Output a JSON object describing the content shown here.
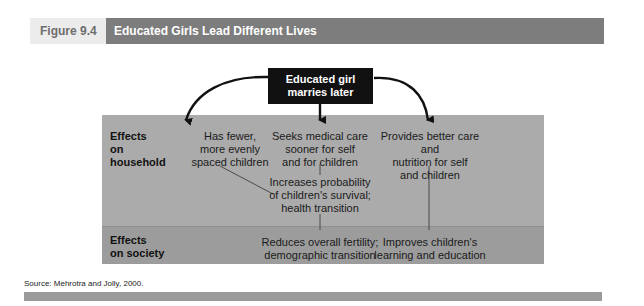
{
  "figure": {
    "label": "Figure 9.4",
    "title": "Educated Girls Lead Different Lives"
  },
  "diagram": {
    "root": "Educated girl marries later",
    "root_lines": [
      "Educated girl",
      "marries later"
    ],
    "rows": {
      "household": {
        "label_lines": [
          "Effects",
          "on",
          "household"
        ]
      },
      "society": {
        "label_lines": [
          "Effects",
          "on society"
        ]
      }
    },
    "nodes": {
      "fewer_children": [
        "Has fewer,",
        "more evenly",
        "spaced children"
      ],
      "medical_care": [
        "Seeks medical care",
        "sooner for self",
        "and for children"
      ],
      "better_care": [
        "Provides better care and",
        "nutrition for self",
        "and children"
      ],
      "survival": [
        "Increases probability",
        "of children's survival;",
        "health transition"
      ],
      "fertility": [
        "Reduces overall fertility;",
        "demographic transition"
      ],
      "education": [
        "Improves children's",
        "learning and education"
      ]
    },
    "edges": [
      [
        "root",
        "fewer_children"
      ],
      [
        "root",
        "medical_care"
      ],
      [
        "root",
        "better_care"
      ],
      [
        "medical_care",
        "survival"
      ],
      [
        "fewer_children",
        "survival"
      ],
      [
        "survival",
        "fertility"
      ],
      [
        "better_care",
        "education"
      ]
    ]
  },
  "source": "Source: Mehrotra and Jolly, 2000.",
  "colors": {
    "title_band": "#7d7d7d",
    "household_panel": "#ababab",
    "society_panel": "#9c9c9c",
    "root_box": "#111111"
  }
}
